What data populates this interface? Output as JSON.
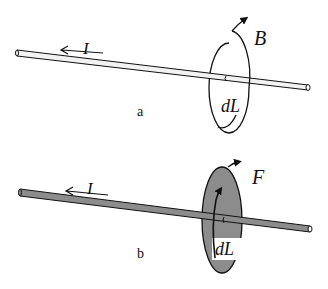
{
  "figure": {
    "panel_a": {
      "caption": "a",
      "current_label": "I",
      "field_label": "B",
      "element_label": "dL",
      "rod_color": "#f2f2f2",
      "loop_fill": "none"
    },
    "panel_b": {
      "caption": "b",
      "current_label": "I",
      "field_label": "F",
      "element_label": "dL",
      "rod_color": "#8c8c8c",
      "loop_fill": "#8c8c8c"
    }
  }
}
